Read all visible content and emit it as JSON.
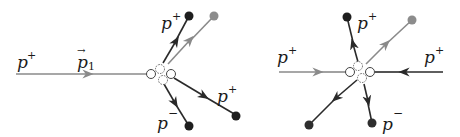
{
  "colors": {
    "dark": "#2a2a2a",
    "gray": "#8a8a8a",
    "dot_dark": "#1e1e1e",
    "dot_gray": "#8c8c8c",
    "background": "#ffffff"
  },
  "left_diagram": {
    "incoming": {
      "label": "p",
      "sup": "+",
      "momentum_label": "p",
      "momentum_sub": "1",
      "momentum_vector": "→"
    },
    "outgoing": [
      {
        "label": "p",
        "sup": "+",
        "direction": "up-left"
      },
      {
        "label": "",
        "sup": "",
        "direction": "up-right",
        "color": "gray"
      },
      {
        "label": "p",
        "sup": "+",
        "direction": "down-right"
      },
      {
        "label": "p",
        "sup": "−",
        "direction": "down"
      }
    ]
  },
  "right_diagram": {
    "incoming": [
      {
        "label": "p",
        "sup": "+",
        "side": "left",
        "color": "gray"
      },
      {
        "label": "p",
        "sup": "+",
        "side": "right",
        "color": "dark"
      }
    ],
    "outgoing": [
      {
        "label": "p",
        "sup": "+",
        "direction": "up"
      },
      {
        "label": "",
        "sup": "",
        "direction": "up-right",
        "color": "gray"
      },
      {
        "label": "",
        "sup": "",
        "direction": "down-left"
      },
      {
        "label": "p",
        "sup": "−",
        "direction": "down"
      }
    ]
  }
}
